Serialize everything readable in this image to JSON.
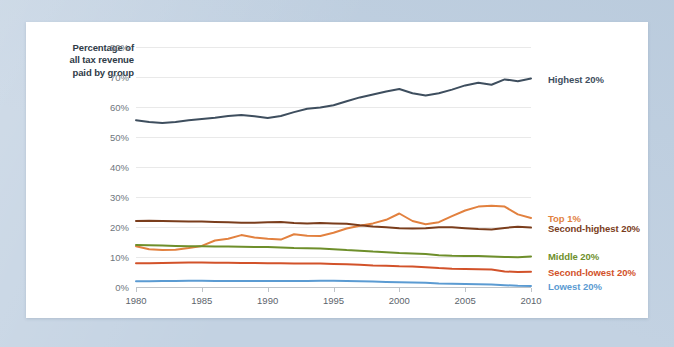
{
  "chart_data": {
    "type": "line",
    "title": "",
    "ylabel": "Percentage of all tax revenue paid by group",
    "xlabel": "",
    "xlim": [
      1980,
      2010
    ],
    "ylim": [
      0,
      80
    ],
    "grid": true,
    "legend_position": "right-inline",
    "x": [
      1980,
      1981,
      1982,
      1983,
      1984,
      1985,
      1986,
      1987,
      1988,
      1989,
      1990,
      1991,
      1992,
      1993,
      1994,
      1995,
      1996,
      1997,
      1998,
      1999,
      2000,
      2001,
      2002,
      2003,
      2004,
      2005,
      2006,
      2007,
      2008,
      2009,
      2010
    ],
    "xticks": [
      1980,
      1985,
      1990,
      1995,
      2000,
      2005,
      2010
    ],
    "xtick_labels": [
      "1980",
      "1985",
      "1990",
      "1995",
      "2000",
      "2005",
      "2010"
    ],
    "yticks": [
      0,
      10,
      20,
      30,
      40,
      50,
      60,
      70,
      80
    ],
    "ytick_labels": [
      "0%",
      "10%",
      "20%",
      "30%",
      "40%",
      "50%",
      "60%",
      "70%",
      "80%"
    ],
    "series": [
      {
        "name": "Highest 20%",
        "color": "#3e4e5e",
        "label": "Highest 20%",
        "values": [
          55.6,
          55.0,
          54.7,
          55.0,
          55.6,
          56.0,
          56.4,
          57.0,
          57.3,
          56.9,
          56.3,
          57.0,
          58.3,
          59.4,
          59.8,
          60.6,
          61.9,
          63.2,
          64.2,
          65.2,
          66.0,
          64.6,
          63.8,
          64.6,
          65.8,
          67.2,
          68.1,
          67.4,
          69.2,
          68.6,
          69.5
        ]
      },
      {
        "name": "Top 1%",
        "color": "#e2813f",
        "label": "Top 1%",
        "values": [
          13.6,
          12.6,
          12.3,
          12.4,
          13.0,
          13.7,
          15.5,
          16.1,
          17.3,
          16.5,
          16.1,
          15.8,
          17.6,
          17.1,
          17.0,
          18.1,
          19.5,
          20.4,
          21.2,
          22.4,
          24.5,
          22.0,
          20.9,
          21.6,
          23.6,
          25.5,
          26.8,
          27.1,
          26.8,
          24.2,
          23.0
        ]
      },
      {
        "name": "Second-highest 20%",
        "color": "#7a3d1c",
        "label": "Second-highest 20%",
        "values": [
          22.0,
          22.1,
          22.0,
          21.9,
          21.8,
          21.8,
          21.7,
          21.6,
          21.4,
          21.4,
          21.6,
          21.7,
          21.3,
          21.2,
          21.3,
          21.2,
          21.1,
          20.6,
          20.2,
          19.9,
          19.6,
          19.5,
          19.6,
          19.9,
          19.9,
          19.6,
          19.3,
          19.2,
          19.7,
          20.1,
          19.8
        ]
      },
      {
        "name": "Middle 20%",
        "color": "#6e8f2b",
        "label": "Middle 20%",
        "values": [
          14.0,
          13.9,
          13.8,
          13.7,
          13.6,
          13.6,
          13.5,
          13.5,
          13.4,
          13.3,
          13.3,
          13.2,
          13.0,
          12.9,
          12.8,
          12.6,
          12.3,
          12.1,
          11.8,
          11.6,
          11.3,
          11.2,
          11.0,
          10.6,
          10.4,
          10.3,
          10.3,
          10.2,
          10.0,
          9.9,
          10.2
        ]
      },
      {
        "name": "Second-lowest 20%",
        "color": "#d2522a",
        "label": "Second-lowest 20%",
        "values": [
          7.9,
          7.9,
          8.0,
          8.1,
          8.2,
          8.2,
          8.1,
          8.1,
          8.0,
          8.0,
          7.9,
          7.9,
          7.8,
          7.8,
          7.8,
          7.7,
          7.6,
          7.4,
          7.2,
          7.1,
          6.9,
          6.8,
          6.6,
          6.3,
          6.1,
          6.0,
          5.9,
          5.8,
          5.2,
          5.0,
          5.1
        ]
      },
      {
        "name": "Lowest 20%",
        "color": "#5b9bd2",
        "label": "Lowest 20%",
        "values": [
          1.9,
          1.9,
          2.0,
          2.0,
          2.1,
          2.1,
          2.0,
          2.0,
          2.0,
          2.0,
          2.0,
          2.0,
          2.0,
          2.0,
          2.1,
          2.1,
          2.0,
          1.9,
          1.8,
          1.7,
          1.6,
          1.5,
          1.4,
          1.2,
          1.1,
          1.0,
          0.9,
          0.8,
          0.6,
          0.4,
          0.3
        ]
      }
    ]
  },
  "axis": {
    "y_title": "Percentage of\nall tax revenue\npaid by group"
  }
}
